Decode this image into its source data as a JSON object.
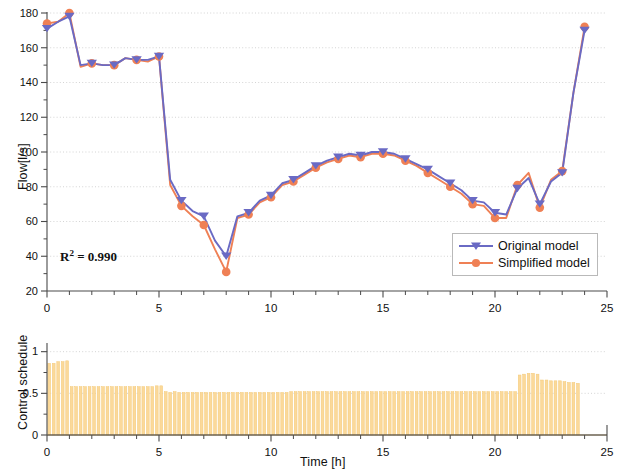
{
  "figure": {
    "background": "#ffffff",
    "panels": 2
  },
  "colors": {
    "original": "#6a6ac4",
    "simplified": "#ef8055",
    "bar_fill": "#fbd99a",
    "bar_edge": "#f3c978",
    "grid": "#c9c9c9",
    "axis": "#4a4a4a",
    "text": "#111111"
  },
  "annotations": {
    "r2_prefix": "R",
    "r2_exponent": "2",
    "r2_value": " = 0.990"
  },
  "legend": {
    "position": "lower-right",
    "entries": [
      {
        "label": "Original model",
        "color": "#6a6ac4",
        "marker": "triangle-down"
      },
      {
        "label": "Simplified model",
        "color": "#ef8055",
        "marker": "circle"
      }
    ]
  },
  "chart_data": [
    {
      "id": "flow-panel",
      "type": "line",
      "title": "",
      "xlabel": "",
      "ylabel": "Flow[l/s]",
      "xlim": [
        0,
        25
      ],
      "ylim": [
        20,
        180
      ],
      "xticks": [
        0,
        5,
        10,
        15,
        20,
        25
      ],
      "xtick_labels": [
        "0",
        "5",
        "10",
        "15",
        "20",
        "25"
      ],
      "xminor_step": 1,
      "yticks": [
        20,
        40,
        60,
        80,
        100,
        120,
        140,
        160,
        180
      ],
      "ytick_labels": [
        "20",
        "40",
        "60",
        "80",
        "100",
        "120",
        "140",
        "160",
        "180"
      ],
      "yminor_step": 10,
      "grid": "y-dotted",
      "legend_position": "lower right",
      "x": [
        0,
        0.5,
        1,
        1.5,
        2,
        2.5,
        3,
        3.5,
        4,
        4.5,
        5,
        5.5,
        6,
        6.5,
        7,
        7.5,
        8,
        8.5,
        9,
        9.5,
        10,
        10.5,
        11,
        11.5,
        12,
        12.5,
        13,
        13.5,
        14,
        14.5,
        15,
        15.5,
        16,
        16.5,
        17,
        17.5,
        18,
        18.5,
        19,
        19.5,
        20,
        20.5,
        21,
        21.5,
        22,
        22.5,
        23,
        23.5,
        24
      ],
      "series": [
        {
          "name": "Original model",
          "color": "#6a6ac4",
          "marker": "triangle-down",
          "marker_every": 2,
          "values": [
            171,
            175,
            178,
            150,
            151,
            150,
            150,
            154,
            153,
            153,
            155,
            84,
            72,
            66,
            63,
            49,
            40,
            63,
            65,
            72,
            75,
            82,
            84,
            88,
            92,
            95,
            97,
            99,
            98,
            100,
            100,
            99,
            96,
            93,
            90,
            86,
            82,
            78,
            72,
            71,
            65,
            64,
            79,
            85,
            70,
            83,
            88,
            134,
            170
          ]
        },
        {
          "name": "Simplified model",
          "color": "#ef8055",
          "marker": "circle",
          "marker_every": 2,
          "values": [
            174,
            175,
            180,
            149,
            151,
            150,
            150,
            154,
            153,
            152,
            155,
            81,
            69,
            63,
            58,
            44,
            31,
            62,
            64,
            71,
            74,
            81,
            83,
            87,
            91,
            94,
            96,
            98,
            97,
            99,
            99,
            98,
            95,
            92,
            88,
            84,
            80,
            76,
            70,
            69,
            62,
            62,
            81,
            88,
            68,
            84,
            89,
            134,
            172
          ]
        }
      ]
    },
    {
      "id": "control-schedule-panel",
      "type": "bar",
      "title": "",
      "xlabel": "Time [h]",
      "ylabel": "Control schedule",
      "xlim": [
        0,
        25
      ],
      "ylim": [
        0,
        1.08
      ],
      "xticks": [
        0,
        5,
        10,
        15,
        20,
        25
      ],
      "xtick_labels": [
        "0",
        "5",
        "10",
        "15",
        "20",
        "25"
      ],
      "xminor_step": 1,
      "yticks": [
        0,
        0.5,
        1
      ],
      "ytick_labels": [
        "0",
        "0.5",
        "1"
      ],
      "yminor_step": 0.25,
      "grid": "y-dotted",
      "bar_color": "#fbd99a",
      "bar_width_ratio": 0.62,
      "x": [
        0.1,
        0.3,
        0.5,
        0.7,
        0.9,
        1.1,
        1.3,
        1.5,
        1.7,
        1.9,
        2.1,
        2.3,
        2.5,
        2.7,
        2.9,
        3.1,
        3.3,
        3.5,
        3.7,
        3.9,
        4.1,
        4.3,
        4.5,
        4.7,
        4.9,
        5.1,
        5.3,
        5.5,
        5.7,
        5.9,
        6.1,
        6.3,
        6.5,
        6.7,
        6.9,
        7.1,
        7.3,
        7.5,
        7.7,
        7.9,
        8.1,
        8.3,
        8.5,
        8.7,
        8.9,
        9.1,
        9.3,
        9.5,
        9.7,
        9.9,
        10.1,
        10.3,
        10.5,
        10.7,
        10.9,
        11.1,
        11.3,
        11.5,
        11.7,
        11.9,
        12.1,
        12.3,
        12.5,
        12.7,
        12.9,
        13.1,
        13.3,
        13.5,
        13.7,
        13.9,
        14.1,
        14.3,
        14.5,
        14.7,
        14.9,
        15.1,
        15.3,
        15.5,
        15.7,
        15.9,
        16.1,
        16.3,
        16.5,
        16.7,
        16.9,
        17.1,
        17.3,
        17.5,
        17.7,
        17.9,
        18.1,
        18.3,
        18.5,
        18.7,
        18.9,
        19.1,
        19.3,
        19.5,
        19.7,
        19.9,
        20.1,
        20.3,
        20.5,
        20.7,
        20.9,
        21.1,
        21.3,
        21.5,
        21.7,
        21.9,
        22.1,
        22.3,
        22.5,
        22.7,
        22.9,
        23.1,
        23.3,
        23.5,
        23.7
      ],
      "values": [
        0.86,
        0.86,
        0.88,
        0.88,
        0.89,
        0.58,
        0.58,
        0.58,
        0.58,
        0.58,
        0.58,
        0.58,
        0.58,
        0.58,
        0.58,
        0.58,
        0.58,
        0.58,
        0.58,
        0.58,
        0.58,
        0.58,
        0.58,
        0.58,
        0.59,
        0.59,
        0.52,
        0.51,
        0.52,
        0.51,
        0.51,
        0.51,
        0.51,
        0.51,
        0.51,
        0.51,
        0.51,
        0.51,
        0.51,
        0.51,
        0.51,
        0.51,
        0.51,
        0.51,
        0.51,
        0.51,
        0.51,
        0.51,
        0.51,
        0.51,
        0.51,
        0.51,
        0.51,
        0.51,
        0.52,
        0.52,
        0.52,
        0.52,
        0.52,
        0.52,
        0.52,
        0.52,
        0.52,
        0.52,
        0.52,
        0.52,
        0.52,
        0.52,
        0.52,
        0.52,
        0.52,
        0.52,
        0.52,
        0.52,
        0.52,
        0.52,
        0.52,
        0.52,
        0.52,
        0.52,
        0.52,
        0.52,
        0.52,
        0.52,
        0.52,
        0.52,
        0.52,
        0.52,
        0.52,
        0.52,
        0.52,
        0.52,
        0.52,
        0.52,
        0.52,
        0.52,
        0.52,
        0.52,
        0.52,
        0.52,
        0.52,
        0.52,
        0.52,
        0.52,
        0.52,
        0.72,
        0.73,
        0.74,
        0.74,
        0.73,
        0.66,
        0.66,
        0.65,
        0.65,
        0.65,
        0.64,
        0.63,
        0.63,
        0.62
      ]
    }
  ]
}
